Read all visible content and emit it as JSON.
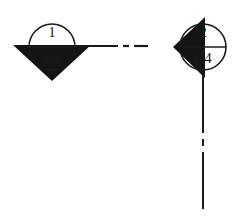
{
  "figure": {
    "type": "engineering-section-marker-diagram",
    "background_color": "#ffffff",
    "line_color": "#1a1a1a",
    "fill_color": "#141414",
    "canvas": {
      "width": 244,
      "height": 219
    }
  },
  "symbols": [
    {
      "id": "section-marker-1",
      "name": "section-cut-marker-left",
      "label_top": "1",
      "label_bottom": "I-4",
      "circle": {
        "cx": 52,
        "cy": 47,
        "r": 23
      },
      "arrow_direction": "down",
      "arrow_points": "13,45 91,45 52,81",
      "divider_line": {
        "x1": 29,
        "y1": 47,
        "x2": 75,
        "y2": 47
      },
      "leader": {
        "kind": "horizontal-dash-dot",
        "y": 46,
        "segments": [
          {
            "x1": 75,
            "x2": 118
          },
          {
            "x1": 123,
            "x2": 129
          },
          {
            "x1": 134,
            "x2": 148
          }
        ]
      }
    },
    {
      "id": "section-marker-2",
      "name": "section-cut-marker-right",
      "label_top": "2",
      "label_bottom": "I-4",
      "circle": {
        "cx": 203,
        "cy": 47,
        "r": 23
      },
      "arrow_direction": "left",
      "arrow_points": "205,17 205,78 173,47",
      "divider_line": {
        "x1": 180,
        "y1": 47,
        "x2": 226,
        "y2": 47
      },
      "leader": {
        "kind": "vertical-dash-dot",
        "x": 203,
        "segments": [
          {
            "y1": 70,
            "y2": 133
          },
          {
            "y1": 139,
            "y2": 146
          },
          {
            "y1": 152,
            "y2": 209
          }
        ]
      }
    }
  ]
}
